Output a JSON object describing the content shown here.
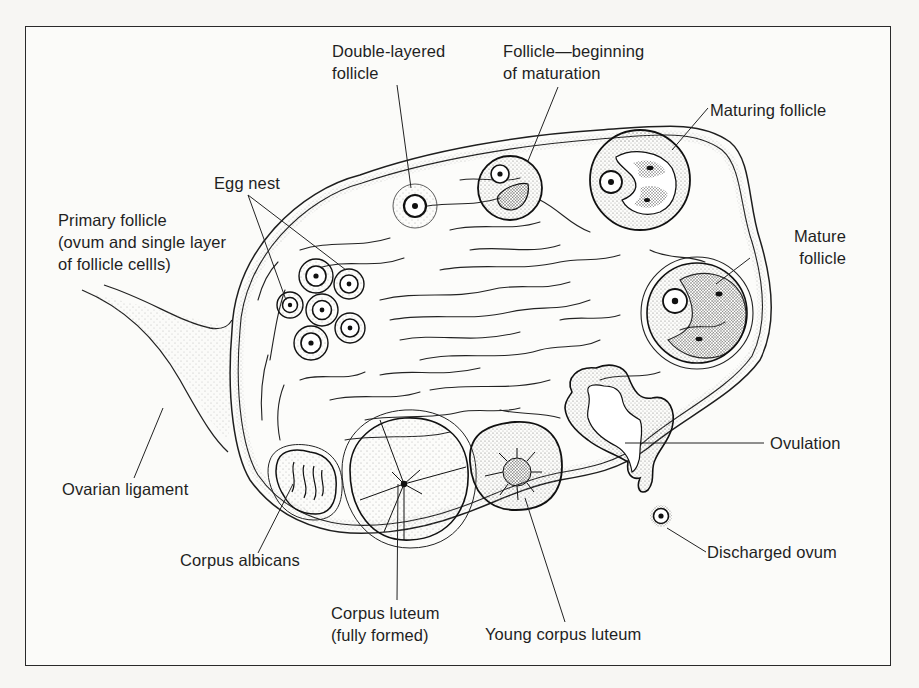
{
  "diagram": {
    "colors": {
      "ink": "#1f1f1f",
      "background": "#fbfbf9",
      "stipple": "#8a8a8a"
    },
    "labels": [
      {
        "id": "double-layered-follicle",
        "text": "Double-layered\nfollicle"
      },
      {
        "id": "follicle-beginning-maturation",
        "text": "Follicle—beginning\nof maturation"
      },
      {
        "id": "maturing-follicle",
        "text": "Maturing follicle"
      },
      {
        "id": "egg-nest",
        "text": "Egg nest"
      },
      {
        "id": "primary-follicle",
        "text": "Primary follicle\n(ovum and single layer\nof follicle cellls)"
      },
      {
        "id": "mature-follicle",
        "text": "Mature\nfollicle"
      },
      {
        "id": "ovulation",
        "text": "Ovulation"
      },
      {
        "id": "ovarian-ligament",
        "text": "Ovarian ligament"
      },
      {
        "id": "discharged-ovum",
        "text": "Discharged ovum"
      },
      {
        "id": "corpus-albicans",
        "text": "Corpus albicans"
      },
      {
        "id": "corpus-luteum-fully-formed",
        "text": "Corpus luteum\n(fully formed)"
      },
      {
        "id": "young-corpus-luteum",
        "text": "Young corpus luteum"
      }
    ]
  }
}
